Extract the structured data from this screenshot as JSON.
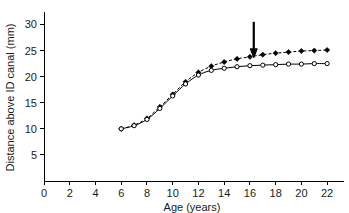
{
  "chart_data": {
    "type": "line",
    "title": "",
    "subtitle": "",
    "xlabel": "Age (years)",
    "ylabel": "Distance above ID canal (mm)",
    "xlim": [
      0,
      23
    ],
    "ylim": [
      0,
      32
    ],
    "xticks": [
      0,
      2,
      4,
      6,
      8,
      10,
      12,
      14,
      16,
      18,
      20,
      22
    ],
    "yticks": [
      5,
      10,
      15,
      20,
      25,
      30
    ],
    "xtick_labels": [
      "0",
      "2",
      "4",
      "6",
      "8",
      "10",
      "12",
      "14",
      "16",
      "18",
      "20",
      "22"
    ],
    "ytick_labels": [
      "5",
      "10",
      "15",
      "20",
      "25",
      "30"
    ],
    "grid": false,
    "legend": "none",
    "x": [
      6,
      7,
      8,
      9,
      10,
      11,
      12,
      13,
      14,
      15,
      16,
      17,
      18,
      19,
      20,
      21,
      22
    ],
    "series": [
      {
        "name": "upper-series",
        "marker": "filled-diamond",
        "linestyle": "dashed",
        "color": "#000000",
        "values": [
          10.0,
          10.7,
          12.0,
          14.2,
          16.6,
          19.0,
          20.8,
          22.0,
          22.8,
          23.4,
          23.8,
          24.2,
          24.5,
          24.7,
          24.9,
          25.0,
          25.1
        ]
      },
      {
        "name": "lower-series",
        "marker": "open-circle",
        "linestyle": "solid",
        "color": "#000000",
        "values": [
          10.0,
          10.6,
          11.8,
          13.9,
          16.3,
          18.6,
          20.3,
          21.2,
          21.6,
          21.9,
          22.1,
          22.2,
          22.3,
          22.4,
          22.4,
          22.5,
          22.5
        ]
      }
    ],
    "annotations": [
      {
        "name": "down-arrow",
        "type": "arrow",
        "direction": "down",
        "x": 16.3,
        "y_top": 30.5,
        "y_tip": 23.6,
        "label": ""
      }
    ]
  },
  "axes": {
    "x_axis_name": "x-axis",
    "y_axis_name": "y-axis"
  }
}
